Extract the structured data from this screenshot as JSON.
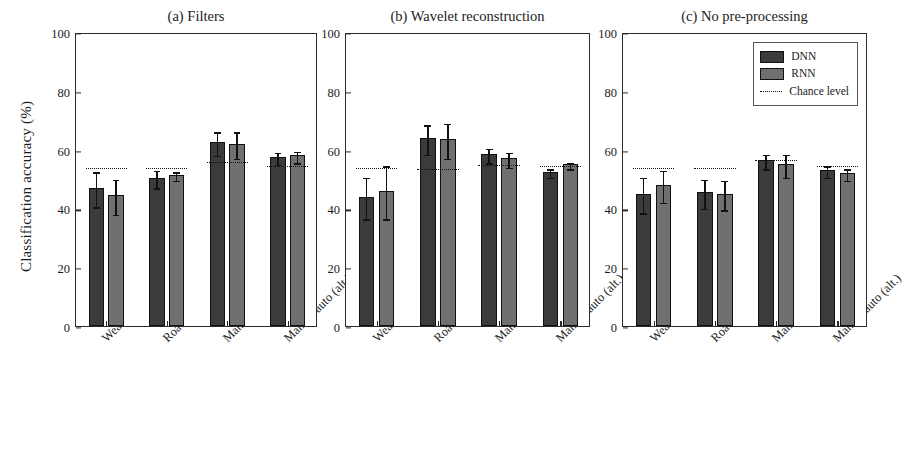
{
  "figure": {
    "ylabel": "Classification accuracy (%)",
    "yticks": [
      0,
      20,
      40,
      60,
      80,
      100
    ],
    "ylim": [
      0,
      100
    ],
    "categories": [
      "Weather",
      "Road type",
      "Manual/auto",
      "Manual/auto (alt.)"
    ],
    "legend": {
      "position": "top-right of panel (c)",
      "entries": [
        {
          "label": "DNN",
          "type": "bar",
          "color": "#3b3b3b"
        },
        {
          "label": "RNN",
          "type": "bar",
          "color": "#707070"
        },
        {
          "label": "Chance level",
          "type": "dotted-line",
          "color": "#111111"
        }
      ]
    }
  },
  "chart_data": [
    {
      "type": "bar",
      "title": "(a) Filters",
      "panel": "a",
      "xlabel": "",
      "ylabel": "Classification accuracy (%)",
      "ylim": [
        0,
        100
      ],
      "yticks": [
        0,
        20,
        40,
        60,
        80,
        100
      ],
      "grid": false,
      "categories": [
        "Weather",
        "Road type",
        "Manual/auto",
        "Manual/auto (alt.)"
      ],
      "series": [
        {
          "name": "DNN",
          "color": "#3b3b3b",
          "values": [
            47.0,
            50.5,
            62.5,
            57.5
          ],
          "errors": [
            6.0,
            3.0,
            4.0,
            2.0
          ]
        },
        {
          "name": "RNN",
          "color": "#707070",
          "values": [
            44.5,
            51.5,
            62.0,
            58.0
          ],
          "errors": [
            6.0,
            1.5,
            4.5,
            2.0
          ]
        }
      ],
      "chance_level": [
        54.5,
        54.5,
        56.5,
        55.0
      ]
    },
    {
      "type": "bar",
      "title": "(b) Wavelet reconstruction",
      "panel": "b",
      "xlabel": "",
      "ylabel": "",
      "ylim": [
        0,
        100
      ],
      "yticks": [
        0,
        20,
        40,
        60,
        80,
        100
      ],
      "grid": false,
      "categories": [
        "Weather",
        "Road type",
        "Manual/auto",
        "Manual/auto (alt.)"
      ],
      "series": [
        {
          "name": "DNN",
          "color": "#3b3b3b",
          "values": [
            44.0,
            64.0,
            58.5,
            52.5
          ],
          "errors": [
            7.0,
            5.0,
            2.5,
            1.5
          ]
        },
        {
          "name": "RNN",
          "color": "#707070",
          "values": [
            46.0,
            63.5,
            57.0,
            55.0
          ],
          "errors": [
            9.0,
            6.0,
            2.5,
            1.0
          ]
        }
      ],
      "chance_level": [
        54.5,
        54.0,
        55.5,
        55.0
      ]
    },
    {
      "type": "bar",
      "title": "(c) No pre-processing",
      "panel": "c",
      "xlabel": "",
      "ylabel": "",
      "ylim": [
        0,
        100
      ],
      "yticks": [
        0,
        20,
        40,
        60,
        80,
        100
      ],
      "grid": false,
      "categories": [
        "Weather",
        "Road type",
        "Manual/auto",
        "Manual/auto (alt.)"
      ],
      "series": [
        {
          "name": "DNN",
          "color": "#3b3b3b",
          "values": [
            45.0,
            45.5,
            56.5,
            53.0
          ],
          "errors": [
            6.0,
            5.0,
            2.5,
            2.0
          ]
        },
        {
          "name": "RNN",
          "color": "#707070",
          "values": [
            48.0,
            45.0,
            55.0,
            52.0
          ],
          "errors": [
            5.5,
            5.0,
            4.0,
            2.0
          ]
        }
      ],
      "chance_level": [
        54.5,
        54.5,
        57.0,
        55.0
      ]
    }
  ]
}
